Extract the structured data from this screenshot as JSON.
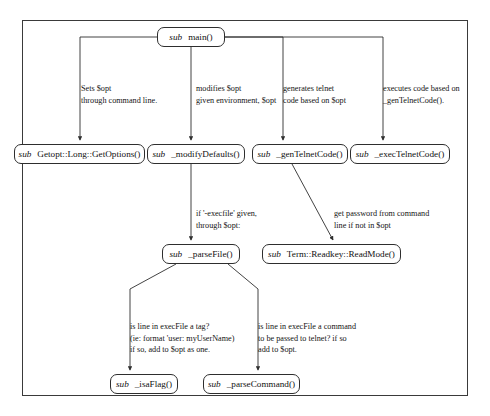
{
  "diagram": {
    "frame": {
      "border_color": "#3a3a3a"
    },
    "nodes": [
      {
        "id": "main",
        "kw": "sub",
        "name": "main()",
        "x": 157,
        "y": 27,
        "w": 68
      },
      {
        "id": "getoptions",
        "kw": "sub",
        "name": "Getopt::Long::GetOptions()",
        "x": 14,
        "y": 144,
        "w": 131
      },
      {
        "id": "modifydef",
        "kw": "sub",
        "name": "_modifyDefaults()",
        "x": 147,
        "y": 144,
        "w": 98
      },
      {
        "id": "gentelnet",
        "kw": "sub",
        "name": "_genTelnetCode()",
        "x": 252,
        "y": 144,
        "w": 96
      },
      {
        "id": "exectelnet",
        "kw": "sub",
        "name": "_execTelnetCode()",
        "x": 350,
        "y": 144,
        "w": 100
      },
      {
        "id": "parsefile",
        "kw": "sub",
        "name": "_parseFile()",
        "x": 162,
        "y": 244,
        "w": 78
      },
      {
        "id": "readmode",
        "kw": "sub",
        "name": "Term::Readkey::ReadMode()",
        "x": 262,
        "y": 244,
        "w": 139
      },
      {
        "id": "isaflag",
        "kw": "sub",
        "name": "_isaFlag()",
        "x": 110,
        "y": 374,
        "w": 68
      },
      {
        "id": "parsecmd",
        "kw": "sub",
        "name": "_parseCommand()",
        "x": 203,
        "y": 374,
        "w": 97
      }
    ],
    "edge_labels": [
      {
        "id": "lbl-getoptions",
        "x": 81,
        "y": 83,
        "lines": [
          "Sets $opt",
          "through command line."
        ]
      },
      {
        "id": "lbl-modifydef",
        "x": 196,
        "y": 83,
        "lines": [
          "modifies $opt",
          "given environment, $opt"
        ]
      },
      {
        "id": "lbl-gentelnet",
        "x": 283,
        "y": 83,
        "lines": [
          "generates telnet",
          "code based on $opt"
        ]
      },
      {
        "id": "lbl-exectelnet",
        "x": 383,
        "y": 83,
        "lines": [
          "executes code based on",
          "_genTelnetCode()."
        ]
      },
      {
        "id": "lbl-parsefile",
        "x": 196,
        "y": 208,
        "lines": [
          "if '-execfile' given,",
          "through $opt:"
        ]
      },
      {
        "id": "lbl-readmode",
        "x": 334,
        "y": 208,
        "lines": [
          "get password from command",
          "line if not in $opt"
        ]
      },
      {
        "id": "lbl-isaflag",
        "x": 130,
        "y": 321,
        "lines": [
          "is line in execFile a tag?",
          "(ie: format 'user:   myUserName)",
          "if so, add to $opt as one."
        ]
      },
      {
        "id": "lbl-parsecmd",
        "x": 258,
        "y": 321,
        "lines": [
          "is line in execFile a command",
          "to be passed to telnet? if so",
          "add to $opt."
        ]
      }
    ],
    "edges": [
      {
        "from": "main",
        "to": "getoptions",
        "label": "lbl-getoptions"
      },
      {
        "from": "main",
        "to": "modifydef",
        "label": "lbl-modifydef"
      },
      {
        "from": "main",
        "to": "gentelnet",
        "label": "lbl-gentelnet"
      },
      {
        "from": "main",
        "to": "exectelnet",
        "label": "lbl-exectelnet"
      },
      {
        "from": "modifydef",
        "to": "parsefile",
        "label": "lbl-parsefile"
      },
      {
        "from": "gentelnet",
        "to": "readmode",
        "label": "lbl-readmode"
      },
      {
        "from": "parsefile",
        "to": "isaflag",
        "label": "lbl-isaflag"
      },
      {
        "from": "parsefile",
        "to": "parsecmd",
        "label": "lbl-parsecmd"
      }
    ]
  }
}
